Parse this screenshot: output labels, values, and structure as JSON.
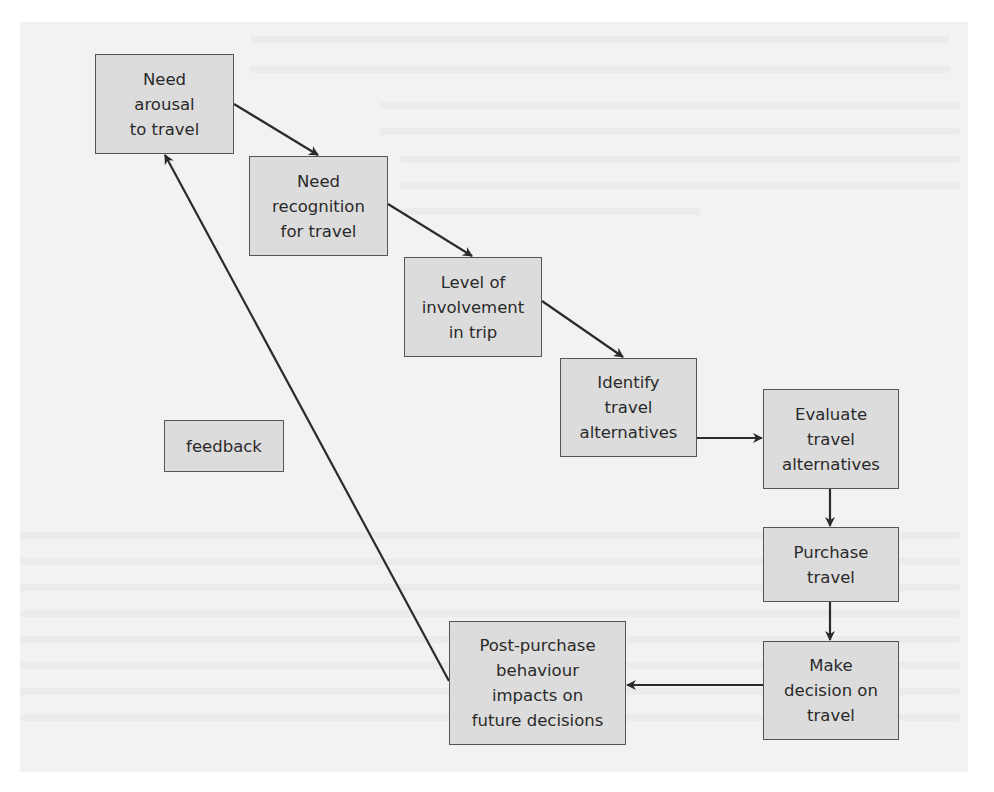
{
  "diagram": {
    "type": "flowchart",
    "colors": {
      "box_fill": "#dcdcdc",
      "box_border": "#555555",
      "arrow": "#2b2b2b",
      "page": "#f2f2f2"
    },
    "nodes": [
      {
        "id": "need-arousal",
        "label": "Need\narousal\nto travel",
        "x": 95,
        "y": 54,
        "w": 139,
        "h": 100
      },
      {
        "id": "need-recognition",
        "label": "Need\nrecognition\nfor travel",
        "x": 249,
        "y": 156,
        "w": 139,
        "h": 100
      },
      {
        "id": "level-involvement",
        "label": "Level of\ninvolvement\nin trip",
        "x": 404,
        "y": 257,
        "w": 138,
        "h": 100
      },
      {
        "id": "identify-alternatives",
        "label": "Identify\ntravel\nalternatives",
        "x": 560,
        "y": 358,
        "w": 137,
        "h": 99
      },
      {
        "id": "evaluate-alternatives",
        "label": "Evaluate\ntravel\nalternatives",
        "x": 763,
        "y": 389,
        "w": 136,
        "h": 100
      },
      {
        "id": "purchase-travel",
        "label": "Purchase\ntravel",
        "x": 763,
        "y": 527,
        "w": 136,
        "h": 75
      },
      {
        "id": "make-decision",
        "label": "Make\ndecision on\ntravel",
        "x": 763,
        "y": 641,
        "w": 136,
        "h": 99
      },
      {
        "id": "post-purchase",
        "label": "Post-purchase\nbehaviour\nimpacts on\nfuture decisions",
        "x": 449,
        "y": 621,
        "w": 177,
        "h": 124
      },
      {
        "id": "feedback",
        "label": "feedback",
        "x": 164,
        "y": 420,
        "w": 120,
        "h": 52
      }
    ],
    "edges": [
      {
        "from": "need-arousal",
        "to": "need-recognition",
        "x1": 234,
        "y1": 104,
        "x2": 318,
        "y2": 155
      },
      {
        "from": "need-recognition",
        "to": "level-involvement",
        "x1": 388,
        "y1": 204,
        "x2": 472,
        "y2": 256
      },
      {
        "from": "level-involvement",
        "to": "identify-alternatives",
        "x1": 542,
        "y1": 301,
        "x2": 623,
        "y2": 357
      },
      {
        "from": "identify-alternatives",
        "to": "evaluate-alternatives",
        "x1": 697,
        "y1": 438,
        "x2": 762,
        "y2": 438
      },
      {
        "from": "evaluate-alternatives",
        "to": "purchase-travel",
        "x1": 830,
        "y1": 489,
        "x2": 830,
        "y2": 526
      },
      {
        "from": "purchase-travel",
        "to": "make-decision",
        "x1": 830,
        "y1": 602,
        "x2": 830,
        "y2": 640
      },
      {
        "from": "make-decision",
        "to": "post-purchase",
        "x1": 763,
        "y1": 685,
        "x2": 627,
        "y2": 685
      },
      {
        "from": "post-purchase",
        "to": "need-arousal",
        "x1": 449,
        "y1": 681,
        "x2": 165,
        "y2": 155,
        "label": "feedback"
      }
    ]
  }
}
